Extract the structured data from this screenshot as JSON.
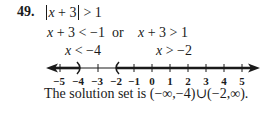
{
  "problem": {
    "number": "49.",
    "inequality": {
      "var": "x",
      "inner": " + 3",
      "rhs": " > 1"
    }
  },
  "cases": {
    "left": {
      "var": "x",
      "expr": " + 3 < −1"
    },
    "connector": "or",
    "right": {
      "var": "x",
      "expr": " + 3 > 1"
    }
  },
  "simplified": {
    "left": {
      "var": "x",
      "expr": " < −4"
    },
    "right": {
      "var": "x",
      "expr": " > −2"
    }
  },
  "number_line": {
    "ticks": [
      "−5",
      "−4",
      "−3",
      "−2",
      "−1",
      "0",
      "1",
      "2",
      "3",
      "4",
      "5"
    ],
    "shaded_left": {
      "open_endpoint": "−4",
      "direction": "left"
    },
    "shaded_right": {
      "open_endpoint": "−2",
      "direction": "right"
    }
  },
  "solution": {
    "prefix": "The solution set is ",
    "set": "(−∞,−4)∪(−2,∞)."
  }
}
